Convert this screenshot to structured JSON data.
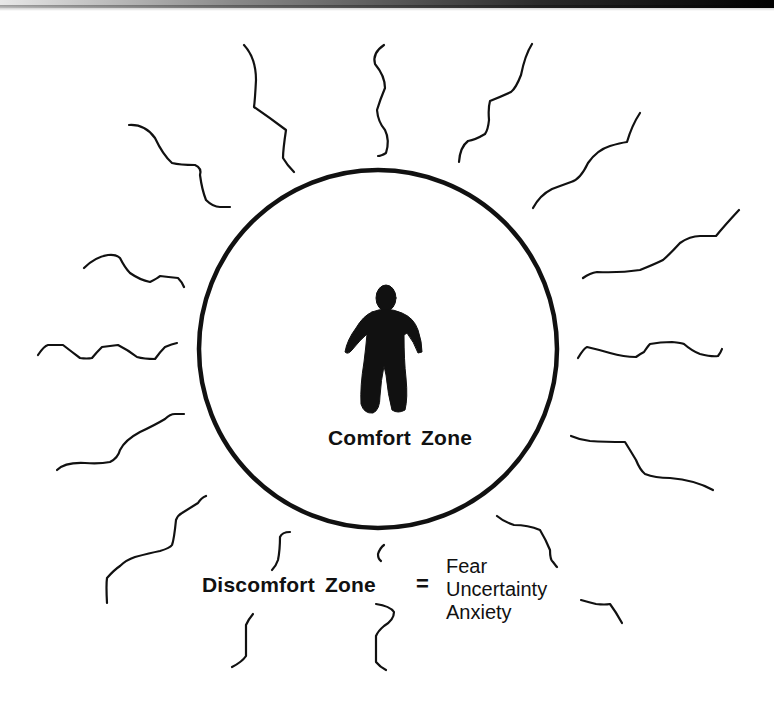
{
  "diagram": {
    "type": "comfort-zone-diagram",
    "inner_zone": {
      "label": "Comfort Zone",
      "shape": "circle",
      "icon": "person-silhouette-icon"
    },
    "outer_zone": {
      "label": "Discomfort Zone",
      "equals": "=",
      "emotions": [
        "Fear",
        "Uncertainty",
        "Anxiety"
      ],
      "decoration": "squiggly-lines-radiating"
    }
  },
  "colors": {
    "ink": "#111111",
    "background": "#ffffff"
  }
}
